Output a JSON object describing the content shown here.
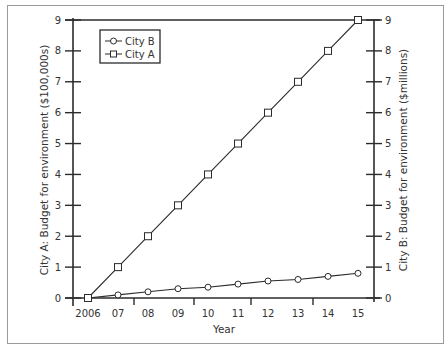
{
  "chart_data": {
    "type": "line",
    "title": "",
    "x": [
      "2006",
      "07",
      "08",
      "09",
      "10",
      "11",
      "12",
      "13",
      "14",
      "15"
    ],
    "xlabel": "Year",
    "ylabel_left": "City A: Budget for environment ($100,000s)",
    "ylabel_right": "City B: Budget for environment ($millions)",
    "ylim_left": [
      0,
      9
    ],
    "ylim_right": [
      0,
      9
    ],
    "yticks_left": [
      0,
      1,
      2,
      3,
      4,
      5,
      6,
      7,
      8,
      9
    ],
    "yticks_right": [
      0,
      1,
      2,
      3,
      4,
      5,
      6,
      7,
      8,
      9
    ],
    "grid": false,
    "legend_position": "upper left",
    "series": [
      {
        "name": "City B",
        "marker": "circle",
        "axis": "right",
        "values": [
          0,
          0.1,
          0.2,
          0.3,
          0.35,
          0.45,
          0.55,
          0.6,
          0.7,
          0.8
        ]
      },
      {
        "name": "City A",
        "marker": "square",
        "axis": "left",
        "values": [
          0,
          1,
          2,
          3,
          4,
          5,
          6,
          7,
          8,
          9
        ]
      }
    ]
  },
  "legend": {
    "items": [
      {
        "label": "City B",
        "marker": "circle"
      },
      {
        "label": "City A",
        "marker": "square"
      }
    ]
  },
  "colors": {
    "line": "#2b2b2b",
    "marker_fill": "#ffffff",
    "frame": "#9a9a9a",
    "text": "#333333"
  }
}
